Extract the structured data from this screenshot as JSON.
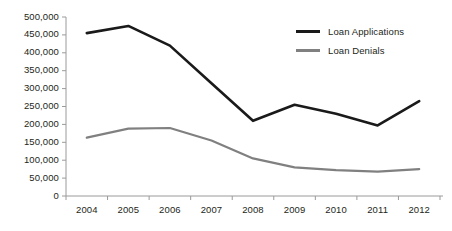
{
  "chart_data": {
    "type": "line",
    "title": "",
    "xlabel": "",
    "ylabel": "",
    "categories": [
      "2004",
      "2005",
      "2006",
      "2007",
      "2008",
      "2009",
      "2010",
      "2011",
      "2012"
    ],
    "x": [
      2004,
      2005,
      2006,
      2007,
      2008,
      2009,
      2010,
      2011,
      2012
    ],
    "series": [
      {
        "name": "Loan Applications",
        "color": "#1a1a1a",
        "values": [
          455000,
          475000,
          420000,
          315000,
          210000,
          255000,
          230000,
          197000,
          265000
        ]
      },
      {
        "name": "Loan Denials",
        "color": "#808080",
        "values": [
          163000,
          188000,
          190000,
          155000,
          105000,
          80000,
          72000,
          68000,
          75000
        ]
      }
    ],
    "ylim": [
      0,
      500000
    ],
    "yticks": [
      0,
      50000,
      100000,
      150000,
      200000,
      250000,
      300000,
      350000,
      400000,
      450000,
      500000
    ],
    "ytick_labels": [
      "0",
      "50,000",
      "100,000",
      "150,000",
      "200,000",
      "250,000",
      "300,000",
      "350,000",
      "400,000",
      "450,000",
      "500,000"
    ],
    "xtick_labels": [
      "2004",
      "2005",
      "2006",
      "2007",
      "2008",
      "2009",
      "2010",
      "2011",
      "2012"
    ],
    "grid": false,
    "legend_position": "top-right",
    "legend": [
      {
        "label": "Loan Applications",
        "color": "#1a1a1a",
        "style": "thick"
      },
      {
        "label": "Loan Denials",
        "color": "#808080",
        "style": "thin"
      }
    ]
  },
  "axes": {
    "axis_color": "#9a9a9a",
    "plot_left": 66,
    "plot_right": 440,
    "plot_top": 17,
    "plot_bottom": 196
  }
}
